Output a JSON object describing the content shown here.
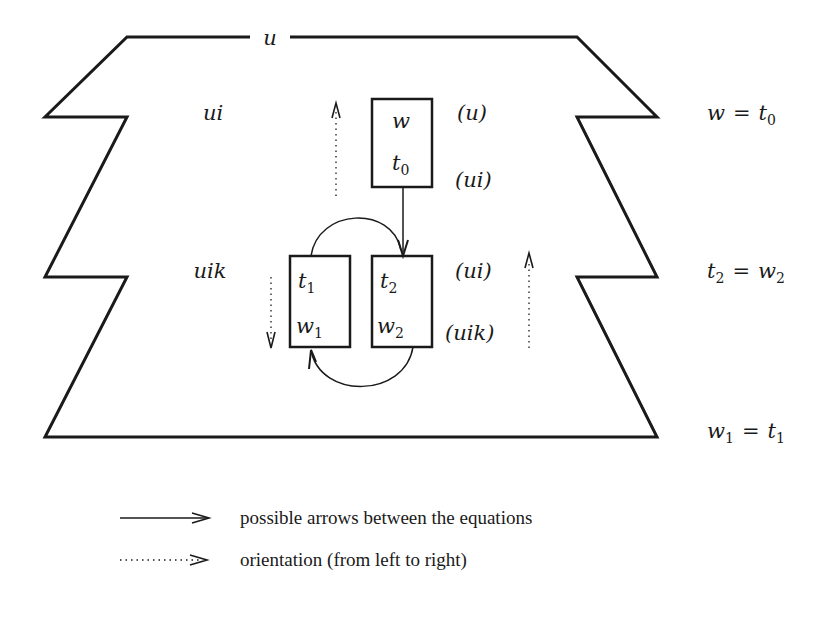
{
  "diagram": {
    "top_label": "u",
    "region_labels": {
      "ui": "ui",
      "uik": "uik"
    },
    "boxes": [
      {
        "id": "box-w-t0",
        "top": "w",
        "bottom_base": "t",
        "bottom_sub": "0"
      },
      {
        "id": "box-t1-w1",
        "top_base": "t",
        "top_sub": "1",
        "bottom_base": "w",
        "bottom_sub": "1"
      },
      {
        "id": "box-t2-w2",
        "top_base": "t",
        "top_sub": "2",
        "bottom_base": "w",
        "bottom_sub": "2"
      }
    ],
    "annotations": {
      "u_paren": "(u)",
      "ui_paren_top": "(ui)",
      "ui_paren_mid": "(ui)",
      "uik_paren": "(uik)"
    },
    "equations": [
      {
        "lhs": "w",
        "eq": "=",
        "rhs_base": "t",
        "rhs_sub": "0"
      },
      {
        "lhs_base": "t",
        "lhs_sub": "2",
        "eq": "=",
        "rhs_base": "w",
        "rhs_sub": "2"
      },
      {
        "lhs_base": "w",
        "lhs_sub": "1",
        "eq": "=",
        "rhs_base": "t",
        "rhs_sub": "1"
      }
    ],
    "colors": {
      "stroke": "#1a1a1a",
      "background": "#ffffff"
    }
  },
  "legend": {
    "items": [
      {
        "style": "solid-arrow",
        "label": "possible arrows between the equations"
      },
      {
        "style": "dotted-arrow",
        "label": "orientation (from left to right)"
      }
    ]
  }
}
